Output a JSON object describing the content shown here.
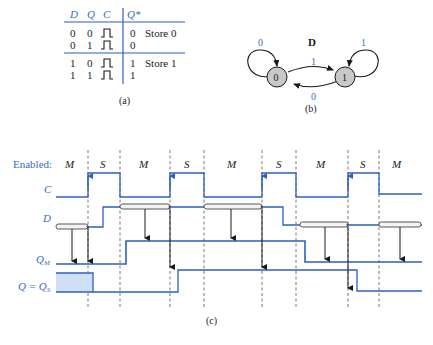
{
  "colors": {
    "blue": "#2f5fbf",
    "label_blue": "#3a6cc0",
    "black": "#1a1a1a",
    "node_fill": "#c8c8c8",
    "shade": "#cfe0f5"
  },
  "table_a": {
    "headers": [
      "D",
      "Q",
      "C",
      "Q*"
    ],
    "rows": [
      {
        "D": "0",
        "Q": "0",
        "Q_next": "0",
        "note": "Store 0"
      },
      {
        "D": "0",
        "Q": "1",
        "Q_next": "0",
        "note": ""
      },
      {
        "D": "1",
        "Q": "0",
        "Q_next": "1",
        "note": "Store 1"
      },
      {
        "D": "1",
        "Q": "1",
        "Q_next": "1",
        "note": ""
      }
    ],
    "caption": "(a)"
  },
  "state_diagram_b": {
    "title": "D",
    "states": [
      "0",
      "1"
    ],
    "transitions": [
      {
        "from": "0",
        "to": "0",
        "label": "0"
      },
      {
        "from": "0",
        "to": "1",
        "label": "1"
      },
      {
        "from": "1",
        "to": "0",
        "label": "0"
      },
      {
        "from": "1",
        "to": "1",
        "label": "1"
      }
    ],
    "caption": "(b)"
  },
  "timing_c": {
    "enabled_label": "Enabled:",
    "phases": [
      "M",
      "S",
      "M",
      "S",
      "M",
      "S",
      "M",
      "S",
      "M"
    ],
    "signals": {
      "C": "C",
      "D": "D",
      "QM": "Q",
      "QM_sub": "M",
      "QS_prefix": "Q = Q",
      "QS_sub": "S"
    },
    "caption": "(c)"
  }
}
